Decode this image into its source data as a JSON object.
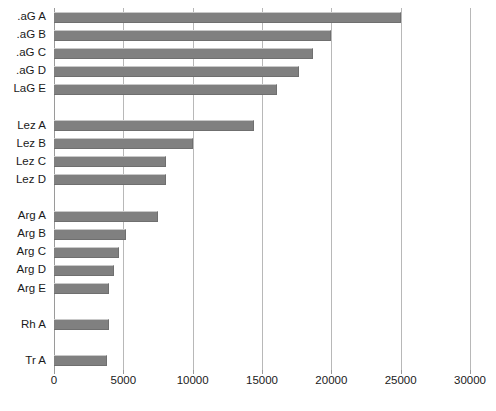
{
  "chart_data": {
    "type": "bar",
    "orientation": "horizontal",
    "title": "",
    "subtitle": "",
    "xlabel": "",
    "ylabel": "",
    "xlim": [
      0,
      30000
    ],
    "ylim": null,
    "grid": true,
    "grid_axis": "x",
    "legend": false,
    "legend_position": "none",
    "bar_color": "#808080",
    "gridline_color": "#b8b8b8",
    "background": "#ffffff",
    "xticks": [
      0,
      5000,
      10000,
      15000,
      20000,
      25000,
      30000
    ],
    "xtick_labels": [
      "0",
      "5000",
      "10000",
      "15000",
      "20000",
      "25000",
      "30000"
    ],
    "categories": [
      "Tr A",
      "Rh A",
      "Arg E",
      "Arg D",
      "Arg C",
      "Arg B",
      "Arg A",
      "Lez D",
      "Lez C",
      "Lez B",
      "Lez A",
      "LaG E",
      "LaG D",
      "LaG C",
      "LaG B",
      "LaG A"
    ],
    "values": [
      3800,
      4000,
      4000,
      4300,
      4700,
      5200,
      7500,
      8100,
      8100,
      10000,
      14400,
      16100,
      17700,
      18700,
      20000,
      25000
    ],
    "note_label_clipping": "Left category labels are cropped by the image edge; 'LaG' entries render as '.aG' / 'LaG E' partially cut."
  },
  "rendered_labels": [
    "Tr A",
    "Rh A",
    "Arg E",
    "Arg D",
    "Arg C",
    "Arg B",
    "Arg A",
    "Lez D",
    "Lez C",
    "Lez B",
    "Lez A",
    "LaG E",
    ".aG D",
    ".aG C",
    ".aG B",
    ".aG A"
  ]
}
